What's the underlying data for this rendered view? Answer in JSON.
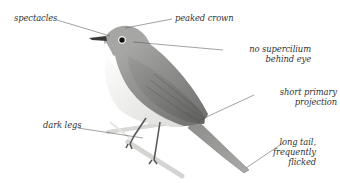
{
  "diagram": {
    "labels": {
      "spectacles": "spectacles",
      "peaked_crown": "peaked crown",
      "no_supercilium": [
        "no supercilium",
        "behind eye"
      ],
      "short_primary": [
        "short primary",
        "projection"
      ],
      "dark_legs": "dark legs",
      "long_tail": [
        "long tail,",
        "frequently",
        "flicked"
      ]
    },
    "colors": {
      "label_text": "#333333",
      "leader_line": "#555555",
      "bird_back": "#8a8a88",
      "bird_belly": "#f4f4f2"
    }
  }
}
